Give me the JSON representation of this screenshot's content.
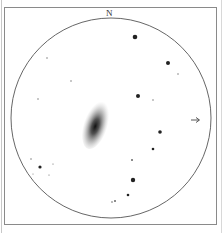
{
  "sketch": {
    "title": "eyepiece-sketch-galaxy",
    "north_label": "N",
    "direction_arrow": "→",
    "field_circle": {
      "cx": 111,
      "cy": 118,
      "r": 100
    },
    "galaxy": {
      "cx": 96,
      "cy": 124,
      "rx": 12,
      "ry": 26,
      "rotation": 18
    },
    "stars": [
      {
        "x": 135,
        "y": 37,
        "r": 2.3
      },
      {
        "x": 168,
        "y": 63,
        "r": 2.0
      },
      {
        "x": 178,
        "y": 74,
        "r": 0.7
      },
      {
        "x": 47,
        "y": 58,
        "r": 0.7
      },
      {
        "x": 71,
        "y": 81,
        "r": 0.7
      },
      {
        "x": 138,
        "y": 96,
        "r": 2.0
      },
      {
        "x": 153,
        "y": 100,
        "r": 0.7
      },
      {
        "x": 38,
        "y": 99,
        "r": 0.7
      },
      {
        "x": 160,
        "y": 132,
        "r": 1.8
      },
      {
        "x": 153,
        "y": 149,
        "r": 1.3
      },
      {
        "x": 132,
        "y": 160,
        "r": 1.0
      },
      {
        "x": 31,
        "y": 159,
        "r": 0.7
      },
      {
        "x": 40,
        "y": 167,
        "r": 1.6
      },
      {
        "x": 53,
        "y": 164,
        "r": 0.6
      },
      {
        "x": 49,
        "y": 175,
        "r": 0.6
      },
      {
        "x": 33,
        "y": 174,
        "r": 0.5
      },
      {
        "x": 133,
        "y": 180,
        "r": 2.2
      },
      {
        "x": 128,
        "y": 195,
        "r": 1.3
      },
      {
        "x": 115,
        "y": 201,
        "r": 1.0
      },
      {
        "x": 112,
        "y": 202,
        "r": 0.8
      }
    ]
  }
}
